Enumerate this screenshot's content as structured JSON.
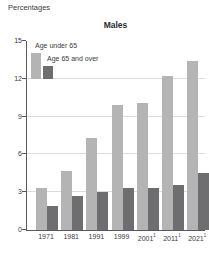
{
  "header": {
    "units_label": "Percentages",
    "title": "Males"
  },
  "legend": {
    "items": [
      {
        "label": "Age under 65",
        "color": "#b4b4b4"
      },
      {
        "label": "Age 65 and over",
        "color": "#6e6e70"
      }
    ]
  },
  "chart_data": {
    "type": "bar",
    "title": "Males",
    "units_label": "Percentages",
    "categories": [
      "1971",
      "1981",
      "1991",
      "1999",
      "2001",
      "2011",
      "2021"
    ],
    "category_superscripts": [
      "",
      "",
      "",
      "",
      "1",
      "1",
      "1"
    ],
    "series": [
      {
        "name": "Age under 65",
        "color": "#b4b4b4",
        "values": [
          3.3,
          4.7,
          7.3,
          9.9,
          10.1,
          12.2,
          13.4
        ]
      },
      {
        "name": "Age 65 and over",
        "color": "#6e6e70",
        "values": [
          1.9,
          2.7,
          3.0,
          3.3,
          3.3,
          3.6,
          4.5
        ]
      }
    ],
    "ylim": [
      0,
      15
    ],
    "yticks": [
      0,
      3,
      6,
      9,
      12,
      15
    ],
    "gridlines": [
      3,
      6,
      9,
      12
    ],
    "grid": true,
    "legend_position": "top-left-inside",
    "xlabel": "",
    "ylabel": "Percentages"
  },
  "colors": {
    "axis": "#5a5a5c",
    "gridline": "#dcdcdc",
    "text": "#3a3a3c",
    "background": "#ffffff"
  }
}
